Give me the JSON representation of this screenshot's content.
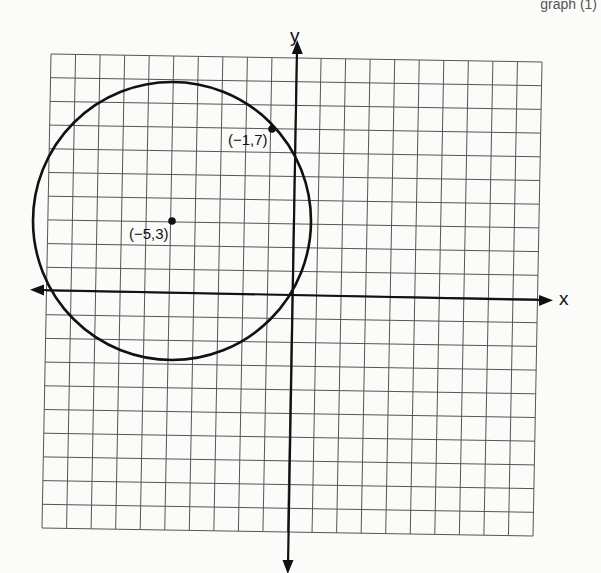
{
  "header": {
    "fragment_text": "graph (1)"
  },
  "graph": {
    "grid": {
      "x_min": -10,
      "x_max": 10,
      "y_min": -10,
      "y_max": 10,
      "step": 1
    },
    "axes": {
      "x_label": "x",
      "y_label": "y"
    },
    "circle": {
      "center": [
        -5,
        3
      ],
      "radius": 5.657,
      "passes_through": [
        -1,
        7
      ]
    },
    "points": [
      {
        "x": -1,
        "y": 7,
        "label": "(−1,7)"
      },
      {
        "x": -5,
        "y": 3,
        "label": "(−5,3)"
      }
    ]
  },
  "chart_data": {
    "type": "scatter",
    "title": "",
    "xlabel": "x",
    "ylabel": "y",
    "xlim": [
      -10,
      10
    ],
    "ylim": [
      -10,
      10
    ],
    "grid": true,
    "series": [
      {
        "name": "points",
        "x": [
          -1,
          -5
        ],
        "y": [
          7,
          3
        ],
        "labels": [
          "(−1,7)",
          "(−5,3)"
        ]
      }
    ],
    "annotations": [
      {
        "type": "circle",
        "center": [
          -5,
          3
        ],
        "radius": 5.657,
        "through": [
          -1,
          7
        ]
      }
    ]
  }
}
